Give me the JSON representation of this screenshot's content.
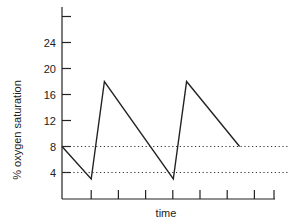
{
  "chart_data": {
    "type": "line",
    "title": "",
    "xlabel": "time",
    "ylabel": "% oxygen saturation",
    "ylim": [
      0,
      28
    ],
    "yticks": [
      4,
      8,
      12,
      16,
      20,
      24,
      28
    ],
    "ytick_labels": [
      "4",
      "8",
      "12",
      "16",
      "20",
      "24",
      ""
    ],
    "xticks_count": 8,
    "x_tick_labels": [],
    "grid": false,
    "legend": null,
    "series": [
      {
        "name": "oxygen saturation",
        "style": "solid",
        "points": [
          {
            "x": 0,
            "y": 8
          },
          {
            "x": 1.1,
            "y": 3
          },
          {
            "x": 1.6,
            "y": 18
          },
          {
            "x": 4.2,
            "y": 3
          },
          {
            "x": 4.7,
            "y": 18
          },
          {
            "x": 6.7,
            "y": 8
          }
        ]
      }
    ],
    "reference_lines": [
      {
        "y": 8,
        "style": "dotted"
      },
      {
        "y": 4,
        "style": "dotted"
      }
    ]
  }
}
